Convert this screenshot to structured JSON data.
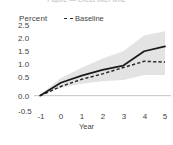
{
  "title_clipped": "Figure — effect over time",
  "axes": {
    "y_unit_label": "Percent",
    "x_title": "Year",
    "y_ticks": [
      "2.5",
      "2.0",
      "1.5",
      "1.0",
      "0.5",
      "0.0",
      "-0.5"
    ],
    "x_ticks": [
      "-1",
      "0",
      "1",
      "2",
      "3",
      "4",
      "5"
    ]
  },
  "legend": {
    "entries": [
      {
        "label": "Baseline",
        "style": "dashed",
        "color": "#2b2b2b"
      }
    ]
  },
  "colors": {
    "line": "#1a1a1a",
    "baseline": "#2b2b2b",
    "band": "#e3e3e3",
    "zero_line": "#b5b5b5",
    "text": "#3f3f3f"
  },
  "chart_data": {
    "type": "line",
    "title": "",
    "xlabel": "Year",
    "ylabel": "Percent",
    "xlim": [
      -1,
      5
    ],
    "ylim": [
      -0.5,
      2.5
    ],
    "grid": false,
    "legend_position": "top-center",
    "x": [
      -1,
      0,
      1,
      2,
      3,
      4,
      5
    ],
    "series": [
      {
        "name": "Estimate",
        "style": "solid",
        "color": "#1a1a1a",
        "values": [
          0.0,
          0.45,
          0.7,
          0.9,
          1.05,
          1.55,
          1.72
        ]
      },
      {
        "name": "Baseline",
        "style": "dashed",
        "color": "#2b2b2b",
        "values": [
          0.0,
          0.32,
          0.57,
          0.76,
          0.98,
          1.2,
          1.17
        ]
      }
    ],
    "confidence_band": {
      "name": "95% confidence interval",
      "color": "#e3e3e3",
      "upper": [
        0.02,
        0.62,
        0.97,
        1.3,
        1.55,
        2.1,
        2.25
      ],
      "lower": [
        -0.02,
        0.28,
        0.42,
        0.5,
        0.55,
        0.72,
        0.72
      ]
    },
    "reference_line": {
      "y": 0.0,
      "color": "#b5b5b5"
    }
  }
}
